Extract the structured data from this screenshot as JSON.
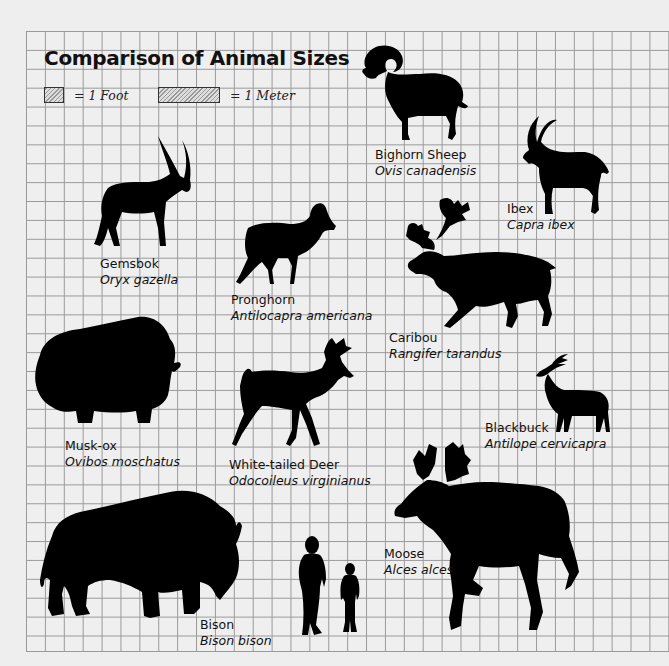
{
  "title": "Comparison of Animal Sizes",
  "legend": [
    {
      "name": "foot",
      "label": "= 1 Foot"
    },
    {
      "name": "meter",
      "label": "= 1 Meter"
    }
  ],
  "animals": [
    {
      "id": "bighorn-sheep",
      "common": "Bighorn Sheep",
      "scientific": "Ovis canadensis"
    },
    {
      "id": "ibex",
      "common": "Ibex",
      "scientific": "Capra ibex"
    },
    {
      "id": "gemsbok",
      "common": "Gemsbok",
      "scientific": "Oryx gazella"
    },
    {
      "id": "pronghorn",
      "common": "Pronghorn",
      "scientific": "Antilocapra americana"
    },
    {
      "id": "caribou",
      "common": "Caribou",
      "scientific": "Rangifer tarandus"
    },
    {
      "id": "musk-ox",
      "common": "Musk-ox",
      "scientific": "Ovibos moschatus"
    },
    {
      "id": "white-tailed-deer",
      "common": "White-tailed Deer",
      "scientific": "Odocoileus virginianus"
    },
    {
      "id": "blackbuck",
      "common": "Blackbuck",
      "scientific": "Antilope cervicapra"
    },
    {
      "id": "moose",
      "common": "Moose",
      "scientific": "Alces alces"
    },
    {
      "id": "bison",
      "common": "Bison",
      "scientific": "Bison bison"
    }
  ],
  "humans": [
    {
      "id": "adult"
    },
    {
      "id": "child"
    }
  ],
  "colors": {
    "background": "#eeeeee",
    "grid_line": "#9a9a9a",
    "silhouette": "#000000"
  }
}
